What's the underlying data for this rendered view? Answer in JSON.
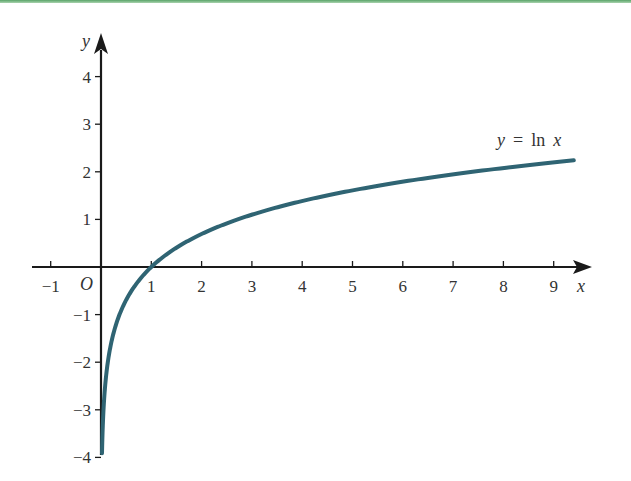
{
  "chart_data": {
    "type": "line",
    "title": "",
    "xlabel": "x",
    "ylabel": "y",
    "origin_label": "O",
    "series": [
      {
        "name": "y = ln x",
        "function": "ln(x)",
        "color": "#2f6473",
        "x": [
          0.02,
          0.05,
          0.1,
          0.25,
          0.5,
          1,
          2,
          3,
          4,
          5,
          6,
          7,
          8,
          9,
          9.4
        ],
        "values": [
          -3.91,
          -3.0,
          -2.3,
          -1.39,
          -0.69,
          0,
          0.69,
          1.1,
          1.39,
          1.61,
          1.79,
          1.95,
          2.08,
          2.2,
          2.24
        ]
      }
    ],
    "annotation": {
      "label_y": "y",
      "label_eq": "=",
      "label_ln": "ln",
      "label_x": "x"
    },
    "x_ticks": [
      -1,
      1,
      2,
      3,
      4,
      5,
      6,
      7,
      8,
      9
    ],
    "y_ticks": [
      4,
      3,
      2,
      1,
      -1,
      -2,
      -3,
      -4
    ],
    "xlim": [
      -1.4,
      9.7
    ],
    "ylim": [
      -4,
      4.6
    ],
    "grid": false,
    "legend": "inline label near curve end"
  },
  "colors": {
    "curve": "#2f6473",
    "axes": "#1a1a1a",
    "top_bar": "#5aa469"
  }
}
